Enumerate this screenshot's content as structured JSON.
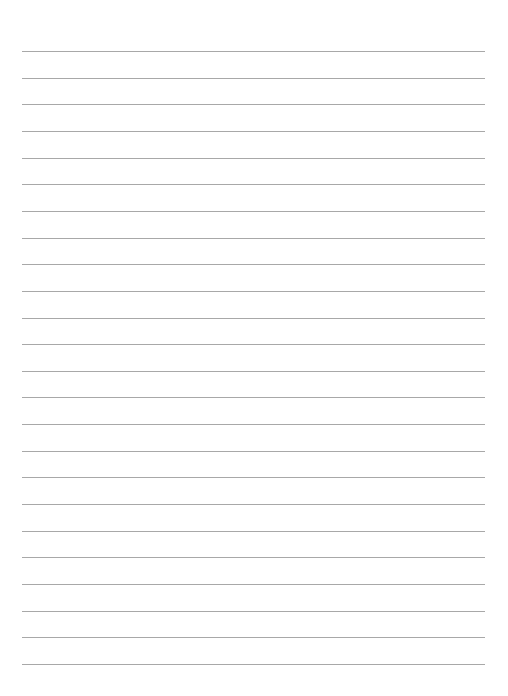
{
  "document": {
    "type": "lined-paper",
    "line_count": 24,
    "first_line_y": 51,
    "line_spacing": 26.65,
    "line_color": "#a8a8a8",
    "background": "#ffffff"
  }
}
